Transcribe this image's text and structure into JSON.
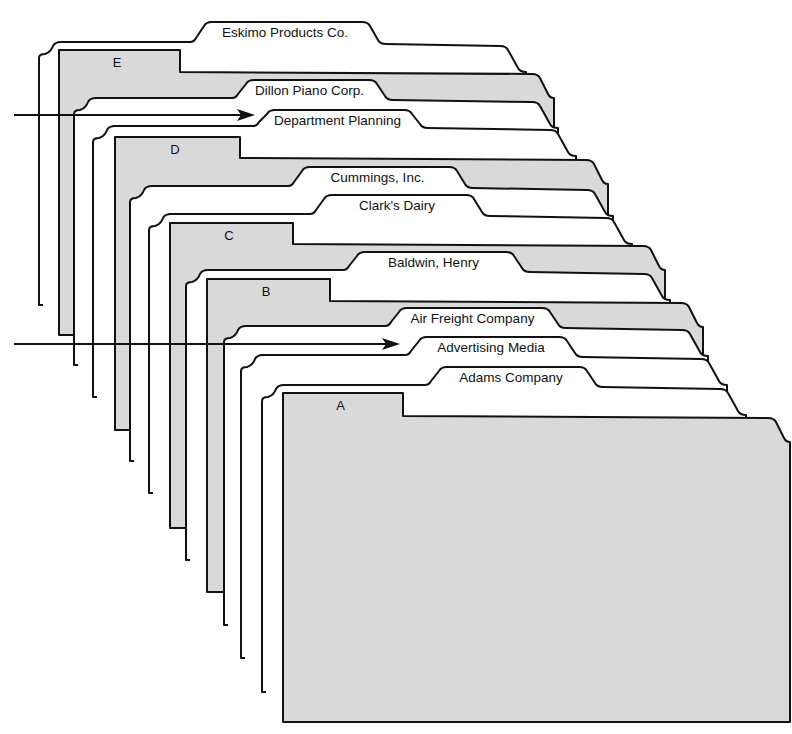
{
  "diagram": {
    "colors": {
      "guide_fill": "#d9d9d9",
      "folder_fill": "#ffffff",
      "stroke": "#111111",
      "background": "#ffffff"
    },
    "cards": [
      {
        "type": "folder",
        "label": "Eskimo Products Co.",
        "left": 41,
        "top": 44,
        "tab_x1": 190,
        "tab_x2": 368,
        "tab_top": 22,
        "right": 540,
        "bottom": 305
      },
      {
        "type": "guide",
        "label": "E",
        "left": 59,
        "top": 50,
        "tab_x2": 180,
        "body_top": 72,
        "right": 554,
        "bottom": 335
      },
      {
        "type": "folder",
        "label": "Dillon Piano Corp.",
        "left": 76,
        "top": 100,
        "tab_x1": 232,
        "tab_x2": 375,
        "tab_top": 80,
        "right": 572,
        "bottom": 365
      },
      {
        "type": "folder",
        "label": "Department Planning",
        "left": 95,
        "top": 128,
        "tab_x1": 253,
        "tab_x2": 410,
        "tab_top": 110,
        "right": 590,
        "bottom": 397
      },
      {
        "type": "guide",
        "label": "D",
        "left": 115,
        "top": 137,
        "tab_x2": 240,
        "body_top": 158,
        "right": 608,
        "bottom": 430
      },
      {
        "type": "folder",
        "label": "Cummings, Inc.",
        "left": 132,
        "top": 188,
        "tab_x1": 288,
        "tab_x2": 455,
        "tab_top": 167,
        "right": 627,
        "bottom": 461
      },
      {
        "type": "folder",
        "label": "Clark's Dairy",
        "left": 151,
        "top": 216,
        "tab_x1": 310,
        "tab_x2": 472,
        "tab_top": 195,
        "right": 646,
        "bottom": 493
      },
      {
        "type": "guide",
        "label": "C",
        "left": 170,
        "top": 223,
        "tab_x2": 293,
        "body_top": 244,
        "right": 665,
        "bottom": 528
      },
      {
        "type": "folder",
        "label": "Baldwin, Henry",
        "left": 188,
        "top": 272,
        "tab_x1": 343,
        "tab_x2": 512,
        "tab_top": 252,
        "right": 684,
        "bottom": 560
      },
      {
        "type": "guide",
        "label": "B",
        "left": 207,
        "top": 279,
        "tab_x2": 330,
        "body_top": 301,
        "right": 703,
        "bottom": 592
      },
      {
        "type": "folder",
        "label": "Air Freight Company",
        "left": 226,
        "top": 328,
        "tab_x1": 385,
        "tab_x2": 548,
        "tab_top": 308,
        "right": 722,
        "bottom": 625
      },
      {
        "type": "folder",
        "label": "Advertising Media",
        "left": 243,
        "top": 357,
        "tab_x1": 405,
        "tab_x2": 565,
        "tab_top": 337,
        "right": 741,
        "bottom": 658
      },
      {
        "type": "folder",
        "label": "Adams Company",
        "left": 264,
        "top": 387,
        "tab_x1": 425,
        "tab_x2": 585,
        "tab_top": 367,
        "right": 760,
        "bottom": 692
      },
      {
        "type": "guide",
        "label": "A",
        "left": 283,
        "top": 393,
        "tab_x2": 403,
        "body_top": 416,
        "right": 790,
        "bottom": 722
      }
    ],
    "arrows": [
      {
        "name": "arrow-to-dillon",
        "x1": 14,
        "y1": 115,
        "x2": 255,
        "y2": 115,
        "points_to": "Department Planning"
      },
      {
        "name": "arrow-to-advertising",
        "x1": 14,
        "y1": 344,
        "x2": 400,
        "y2": 344,
        "points_to": "Advertising Media"
      }
    ]
  }
}
